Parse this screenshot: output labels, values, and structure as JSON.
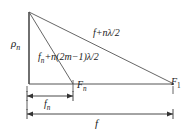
{
  "figure": {
    "background_color": "#ffffff",
    "line_color": "#333333",
    "labels": {
      "rho_n": {
        "base": "ρ",
        "sub": "n"
      },
      "hypotenuse": {
        "text": "f+nλ/2"
      },
      "inner_ray": {
        "prefix": "f",
        "prefix_sub": "n",
        "text": "+n(2m−1)λ/2"
      },
      "point_Fn": {
        "base": "F",
        "sub": "n"
      },
      "point_F1": {
        "base": "F",
        "sub": "1"
      },
      "dim_fn": {
        "base": "f",
        "sub": "n"
      },
      "dim_f": {
        "base": "f",
        "sub": ""
      }
    },
    "geometry": {
      "apex": {
        "x": 29,
        "y": 12
      },
      "origin": {
        "x": 29,
        "y": 84
      },
      "Fn": {
        "x": 73,
        "y": 84
      },
      "F1": {
        "x": 173,
        "y": 84
      },
      "dim_fn_line_y": 96,
      "dim_f_line_y": 114
    }
  }
}
